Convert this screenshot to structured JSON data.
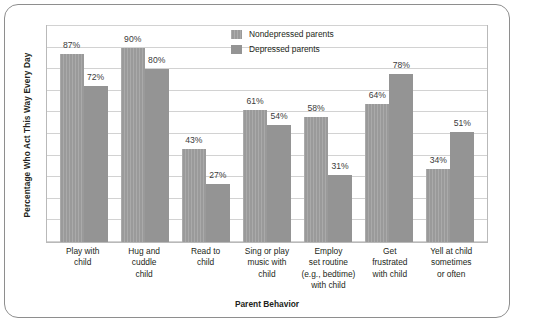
{
  "chart_data": {
    "type": "bar",
    "title": "",
    "xlabel": "Parent Behavior",
    "ylabel": "Percentage Who Act This Way Every Day",
    "ylim": [
      0,
      100
    ],
    "grid": true,
    "gridline_step": 10,
    "legend_position": "top-center",
    "categories": [
      "Play with child",
      "Hug and cuddle child",
      "Read to child",
      "Sing or play music with child",
      "Employ set routine (e.g., bedtime) with child",
      "Get frustrated with child",
      "Yell at child sometimes or often"
    ],
    "category_lines": [
      [
        "Play with",
        "child"
      ],
      [
        "Hug and",
        "cuddle",
        "child"
      ],
      [
        "Read to",
        "child"
      ],
      [
        "Sing or play",
        "music with",
        "child"
      ],
      [
        "Employ",
        "set routine",
        "(e.g., bedtime)",
        "with child"
      ],
      [
        "Get",
        "frustrated",
        "with child"
      ],
      [
        "Yell at child",
        "sometimes",
        "or often"
      ]
    ],
    "series": [
      {
        "name": "Nondepressed parents",
        "color": "#9a9a9a",
        "values": [
          87,
          90,
          43,
          61,
          58,
          64,
          34
        ],
        "labels": [
          "87%",
          "90%",
          "43%",
          "61%",
          "58%",
          "64%",
          "34%"
        ]
      },
      {
        "name": "Depressed parents",
        "color": "#949494",
        "values": [
          72,
          80,
          27,
          54,
          31,
          78,
          51
        ],
        "labels": [
          "72%",
          "80%",
          "27%",
          "54%",
          "31%",
          "78%",
          "51%"
        ]
      }
    ]
  }
}
